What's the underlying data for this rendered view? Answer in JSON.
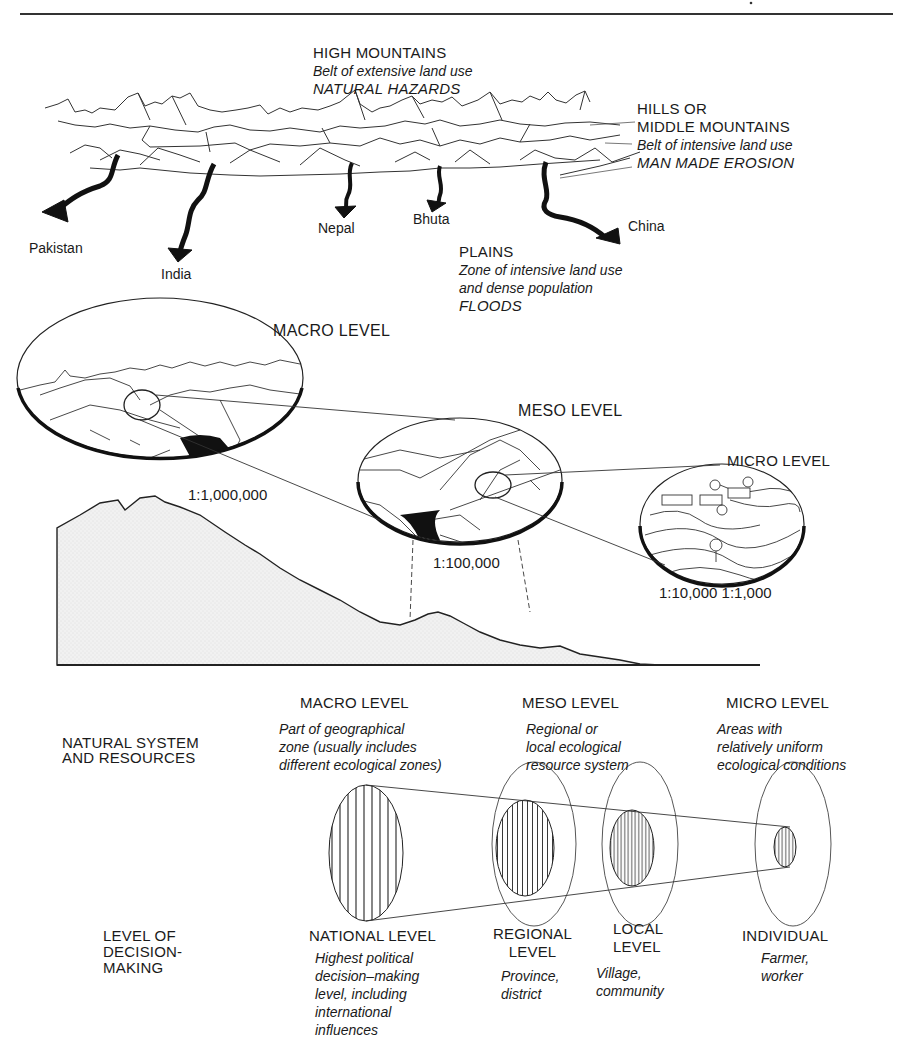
{
  "header": {
    "rule": true
  },
  "top_panel": {
    "high_mountains": {
      "title": "HIGH MOUNTAINS",
      "desc": "Belt of extensive land use",
      "hazard": "NATURAL HAZARDS"
    },
    "hills": {
      "title_line1": "HILLS OR",
      "title_line2": "MIDDLE MOUNTAINS",
      "desc": "Belt of intensive land use",
      "hazard": "MAN MADE EROSION"
    },
    "plains": {
      "title": "PLAINS",
      "desc_line1": "Zone of intensive land use",
      "desc_line2": "and dense population",
      "hazard": "FLOODS"
    },
    "rivers": [
      {
        "label": "Pakistan"
      },
      {
        "label": "India"
      },
      {
        "label": "Nepal"
      },
      {
        "label": "Bhuta"
      },
      {
        "label": "China"
      }
    ]
  },
  "middle_panel": {
    "macro": {
      "title": "MACRO LEVEL",
      "scale": "1:1,000,000"
    },
    "meso": {
      "title": "MESO LEVEL",
      "scale": "1:100,000"
    },
    "micro": {
      "title": "MICRO LEVEL",
      "scale": "1:10,000 1:1,000"
    }
  },
  "bottom_panel": {
    "row_natural": {
      "line1": "NATURAL SYSTEM",
      "line2": "AND RESOURCES"
    },
    "row_decision": {
      "line1": "LEVEL OF",
      "line2": "DECISION-",
      "line3": "MAKING"
    },
    "columns": [
      {
        "header": "MACRO LEVEL",
        "natural_desc": [
          "Part of geographical",
          "zone (usually includes",
          "different ecological zones)"
        ]
      },
      {
        "header": "MESO LEVEL",
        "natural_desc": [
          "Regional or",
          "local ecological",
          "resource system"
        ]
      },
      {
        "header": "MICRO LEVEL",
        "natural_desc": [
          "Areas with",
          "relatively uniform",
          "ecological conditions"
        ]
      }
    ],
    "decision_levels": [
      {
        "title": [
          "NATIONAL LEVEL"
        ],
        "desc": [
          "Highest political",
          "decision–making",
          "level, including",
          "international",
          "influences"
        ]
      },
      {
        "title": [
          "REGIONAL",
          "LEVEL"
        ],
        "desc": [
          "Province,",
          "district"
        ]
      },
      {
        "title": [
          "LOCAL",
          "LEVEL"
        ],
        "desc": [
          "Village,",
          "community"
        ]
      },
      {
        "title": [
          "INDIVIDUAL"
        ],
        "desc": [
          "Farmer,",
          "worker"
        ]
      }
    ]
  }
}
